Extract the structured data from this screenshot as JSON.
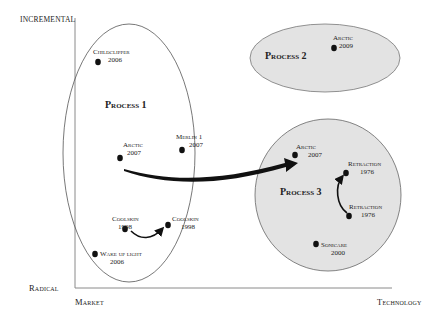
{
  "axes": {
    "y_top": "INCREMENTAL",
    "y_bottom": "Radical",
    "x_left": "Market",
    "x_right": "Technology"
  },
  "processes": [
    {
      "id": "p1",
      "label": "Process 1",
      "fill": "#ffffff",
      "stroke": "#555555"
    },
    {
      "id": "p2",
      "label": "Process 2",
      "fill": "#e3e3e3",
      "stroke": "#777777"
    },
    {
      "id": "p3",
      "label": "Process 3",
      "fill": "#e3e3e3",
      "stroke": "#666666"
    }
  ],
  "points": [
    {
      "name": "Childclipper",
      "year": "2006",
      "process": "p1"
    },
    {
      "name": "Arctic",
      "year": "2007",
      "process": "p1"
    },
    {
      "name": "Merlin 1",
      "year": "2007",
      "process": "p1"
    },
    {
      "name": "Coolskin",
      "year": "1998",
      "process": "p1"
    },
    {
      "name": "Coolskin",
      "year": "1998",
      "process": "p1"
    },
    {
      "name": "Wake up light",
      "year": "2006",
      "process": "p1"
    },
    {
      "name": "Arctic",
      "year": "2009",
      "process": "p2"
    },
    {
      "name": "Arctic",
      "year": "2007",
      "process": "p3"
    },
    {
      "name": "Retraction",
      "year": "1976",
      "process": "p3"
    },
    {
      "name": "Retraction",
      "year": "1976",
      "process": "p3"
    },
    {
      "name": "Sonicare",
      "year": "2000",
      "process": "p3"
    }
  ],
  "arrows": [
    {
      "from": "Arctic 2007 (Process 1)",
      "to": "Arctic 2007 (Process 3)"
    },
    {
      "from": "Coolskin 1998",
      "to": "Coolskin 1998"
    },
    {
      "from": "Retraction 1976",
      "to": "Retraction 1976"
    }
  ],
  "colors": {
    "dot": "#111111",
    "axis": "#888888",
    "process_fill": "#e3e3e3"
  }
}
